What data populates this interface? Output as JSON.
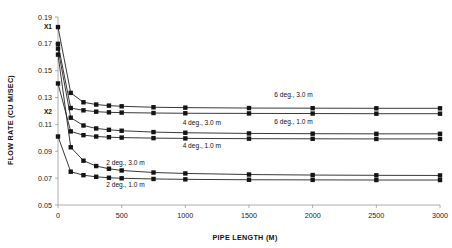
{
  "chart_data": {
    "type": "line",
    "title": "",
    "xlabel": "PIPE LENGTH (M)",
    "ylabel": "FLOW RATE (CU M/SEC)",
    "xlim": [
      0,
      3000
    ],
    "ylim": [
      0.05,
      0.19
    ],
    "grid": false,
    "legend_position": "inline-right",
    "xticks": [
      0,
      500,
      1000,
      1500,
      2000,
      2500,
      3000
    ],
    "xtick_labels": [
      "0",
      "500",
      "1000",
      "1500",
      "2000",
      "2500",
      "3000"
    ],
    "yticks": [
      0.05,
      0.07,
      0.09,
      0.11,
      0.13,
      0.15,
      0.17,
      0.19
    ],
    "ytick_labels": [
      "0.05",
      "0.07",
      "0.09",
      "0.11",
      "0.13",
      "0.15",
      "0.17",
      "0.19"
    ],
    "annotations": [
      {
        "text": "X1",
        "x": 0,
        "y": 0.1825,
        "placement": "y-axis"
      },
      {
        "text": "X2",
        "x": 0,
        "y": 0.1195,
        "placement": "y-axis"
      }
    ],
    "x": [
      0,
      100,
      200,
      300,
      400,
      500,
      750,
      1000,
      1500,
      2000,
      2500,
      3000
    ],
    "series": [
      {
        "name": "6 deg., 3.0 m",
        "label": "6 deg., 3.0 m",
        "label_x": 1850,
        "label_y": 0.1305,
        "values": [
          0.1825,
          0.1335,
          0.1265,
          0.1248,
          0.124,
          0.1235,
          0.1228,
          0.1225,
          0.1222,
          0.1221,
          0.122,
          0.122
        ]
      },
      {
        "name": "6 deg., 1.0 m",
        "label": "6 deg., 1.0 m",
        "label_x": 1850,
        "label_y": 0.1105,
        "values": [
          0.17,
          0.1222,
          0.1205,
          0.1195,
          0.119,
          0.1188,
          0.1185,
          0.1183,
          0.1182,
          0.1181,
          0.118,
          0.118
        ]
      },
      {
        "name": "4 deg., 3.0 m",
        "label": "4 deg., 3.0 m",
        "label_x": 1130,
        "label_y": 0.1095,
        "values": [
          0.1665,
          0.115,
          0.1092,
          0.107,
          0.106,
          0.1053,
          0.1043,
          0.1038,
          0.1033,
          0.1031,
          0.103,
          0.103
        ]
      },
      {
        "name": "4 deg., 1.0 m",
        "label": "4 deg., 1.0 m",
        "label_x": 1130,
        "label_y": 0.0925,
        "values": [
          0.1405,
          0.1048,
          0.102,
          0.101,
          0.1005,
          0.1002,
          0.0998,
          0.0996,
          0.0994,
          0.0993,
          0.0992,
          0.0992
        ]
      },
      {
        "name": "2 deg., 3.0 m",
        "label": "2 deg., 3.0 m",
        "label_x": 530,
        "label_y": 0.08,
        "values": [
          0.162,
          0.093,
          0.083,
          0.079,
          0.077,
          0.0757,
          0.0742,
          0.0735,
          0.0727,
          0.0723,
          0.0721,
          0.072
        ]
      },
      {
        "name": "2 deg., 1.0 m",
        "label": "2 deg., 1.0 m",
        "label_x": 530,
        "label_y": 0.0635,
        "values": [
          0.101,
          0.0748,
          0.0722,
          0.071,
          0.0703,
          0.0699,
          0.0694,
          0.0691,
          0.0688,
          0.0687,
          0.0686,
          0.0686
        ]
      }
    ]
  }
}
